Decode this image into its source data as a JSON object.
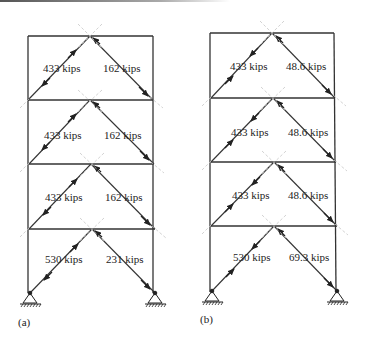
{
  "frames": [
    {
      "id": "a",
      "caption": "(a)",
      "stories": [
        {
          "left_brace": "433 kips",
          "right_brace": "162 kips"
        },
        {
          "left_brace": "433 kips",
          "right_brace": "162 kips"
        },
        {
          "left_brace": "433 kips",
          "right_brace": "162 kips"
        },
        {
          "left_brace": "530 kips",
          "right_brace": "231 kips"
        }
      ]
    },
    {
      "id": "b",
      "caption": "(b)",
      "stories": [
        {
          "left_brace": "433 kips",
          "right_brace": "48.6 kips"
        },
        {
          "left_brace": "433 kips",
          "right_brace": "48.6 kips"
        },
        {
          "left_brace": "433 kips",
          "right_brace": "48.6 kips"
        },
        {
          "left_brace": "530 kips",
          "right_brace": "69.3 kips"
        }
      ]
    }
  ],
  "colors": {
    "line": "#333333",
    "dashed": "#bbbbbb",
    "text": "#222222"
  }
}
